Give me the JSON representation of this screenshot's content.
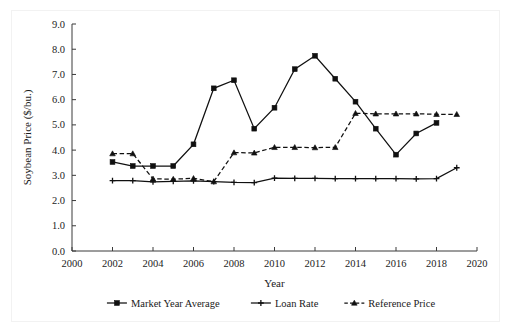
{
  "figure": {
    "ghost_header_text": "",
    "background_color": "#ffffff",
    "ink_color": "#101010"
  },
  "axes": {
    "y_title": "Soybean Price ($/bu.)",
    "x_title": "Year",
    "y_ticks": [
      "0.0",
      "1.0",
      "2.0",
      "3.0",
      "4.0",
      "5.0",
      "6.0",
      "7.0",
      "8.0",
      "9.0"
    ],
    "x_ticks": [
      "2000",
      "2002",
      "2004",
      "2006",
      "2008",
      "2010",
      "2012",
      "2014",
      "2016",
      "2018",
      "2020"
    ]
  },
  "legend": {
    "position": "bottom",
    "items": [
      {
        "label": "Market Year Average",
        "marker": "square",
        "line": "solid"
      },
      {
        "label": "Loan Rate",
        "marker": "plus",
        "line": "solid"
      },
      {
        "label": "Reference Price",
        "marker": "triangle",
        "line": "dashed"
      }
    ]
  },
  "chart_data": {
    "type": "line",
    "title": "",
    "subtitle": "",
    "xlabel": "Year",
    "ylabel": "Soybean Price ($/bu.)",
    "xlim": [
      2000,
      2020
    ],
    "ylim": [
      0.0,
      9.0
    ],
    "xtick_step": 2,
    "ytick_step": 1.0,
    "grid": false,
    "legend_position": "bottom",
    "x": [
      2002,
      2003,
      2004,
      2005,
      2006,
      2007,
      2008,
      2009,
      2010,
      2011,
      2012,
      2013,
      2014,
      2015,
      2016,
      2017,
      2018,
      2019
    ],
    "series": [
      {
        "name": "Market Year Average",
        "marker": "square",
        "line": "solid",
        "x": [
          2002,
          2003,
          2004,
          2005,
          2006,
          2007,
          2008,
          2009,
          2010,
          2011,
          2012,
          2013,
          2014,
          2015,
          2016,
          2017,
          2018
        ],
        "values": [
          3.53,
          3.37,
          3.37,
          3.37,
          4.23,
          6.45,
          6.77,
          4.85,
          5.68,
          7.21,
          7.74,
          6.83,
          5.92,
          4.85,
          3.82,
          4.66,
          5.08
        ]
      },
      {
        "name": "Loan Rate",
        "marker": "plus",
        "line": "solid",
        "x": [
          2002,
          2003,
          2004,
          2005,
          2006,
          2007,
          2008,
          2009,
          2010,
          2011,
          2012,
          2013,
          2014,
          2015,
          2016,
          2017,
          2018,
          2019
        ],
        "values": [
          2.79,
          2.79,
          2.74,
          2.76,
          2.78,
          2.75,
          2.72,
          2.71,
          2.89,
          2.88,
          2.88,
          2.87,
          2.87,
          2.87,
          2.87,
          2.86,
          2.87,
          3.3
        ]
      },
      {
        "name": "Reference Price",
        "marker": "triangle",
        "line": "dashed",
        "x": [
          2002,
          2003,
          2004,
          2005,
          2006,
          2007,
          2008,
          2009,
          2010,
          2011,
          2012,
          2013,
          2014,
          2015,
          2016,
          2017,
          2018,
          2019
        ],
        "values": [
          3.86,
          3.86,
          2.86,
          2.85,
          2.88,
          2.75,
          3.9,
          3.89,
          4.11,
          4.11,
          4.1,
          4.11,
          5.46,
          5.44,
          5.44,
          5.44,
          5.42,
          5.42
        ]
      }
    ]
  }
}
